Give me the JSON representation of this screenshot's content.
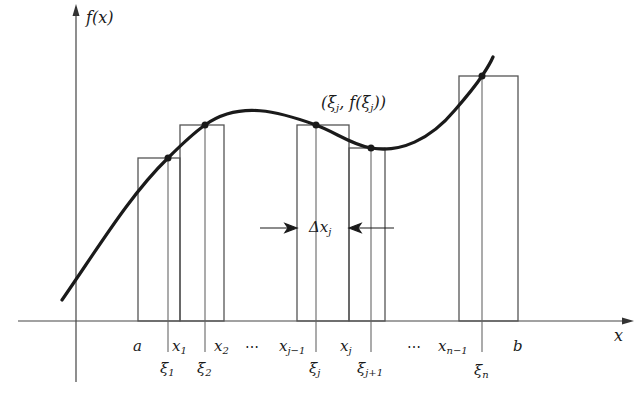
{
  "diagram": {
    "colors": {
      "ink": "#1a1a1a",
      "rect_stroke": "#555555",
      "axis": "#444444",
      "background": "#ffffff"
    },
    "axes": {
      "y_label": "f(x)",
      "x_label": "x"
    },
    "point_label": "(ξj, f(ξj))",
    "point_label_parts": {
      "open": "(ξ",
      "sub1": "j",
      "mid": ", f(ξ",
      "sub2": "j",
      "close": "))"
    },
    "delta_label": {
      "base": "Δx",
      "sub": "j"
    },
    "x_ticks": [
      {
        "base": "a",
        "sub": ""
      },
      {
        "base": "x",
        "sub": "1"
      },
      {
        "base": "x",
        "sub": "2"
      },
      {
        "base": "x",
        "sub": "j−1"
      },
      {
        "base": "x",
        "sub": "j"
      },
      {
        "base": "x",
        "sub": "n−1"
      },
      {
        "base": "b",
        "sub": ""
      }
    ],
    "sample_points": [
      {
        "base": "ξ",
        "sub": "1"
      },
      {
        "base": "ξ",
        "sub": "2"
      },
      {
        "base": "ξ",
        "sub": "j"
      },
      {
        "base": "ξ",
        "sub": "j+1"
      },
      {
        "base": "ξ",
        "sub": "n"
      }
    ],
    "ellipsis": "⋯",
    "rectangles": [
      {
        "left": "a",
        "right": "x1",
        "sample": "ξ1"
      },
      {
        "left": "x1",
        "right": "x2",
        "sample": "ξ2"
      },
      {
        "left": "xj−1",
        "right": "xj",
        "sample": "ξj"
      },
      {
        "left": "xj",
        "right": "xj+1",
        "sample": "ξj+1"
      },
      {
        "left": "xn−1",
        "right": "b",
        "sample": "ξn"
      }
    ]
  }
}
